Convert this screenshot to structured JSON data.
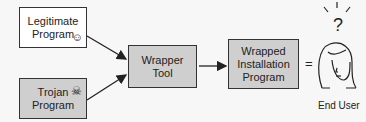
{
  "nodes": {
    "legitimate": {
      "label": "Legitimate\nProgram",
      "icon": "smiley-icon",
      "fill": "#ffffff"
    },
    "trojan": {
      "label": "Trojan\nProgram",
      "icon": "skull-crossbones-icon",
      "fill": "#cfcfcf"
    },
    "wrapper": {
      "label": "Wrapper\nTool",
      "fill": "#cfcfcf"
    },
    "wrapped": {
      "label": "Wrapped\nInstallation\nProgram",
      "fill": "#cfcfcf"
    }
  },
  "equals": "=",
  "end_user": {
    "label": "End User",
    "thought": "?"
  },
  "edges": [
    {
      "from": "legitimate",
      "to": "wrapper"
    },
    {
      "from": "trojan",
      "to": "wrapper"
    },
    {
      "from": "wrapper",
      "to": "wrapped"
    }
  ]
}
